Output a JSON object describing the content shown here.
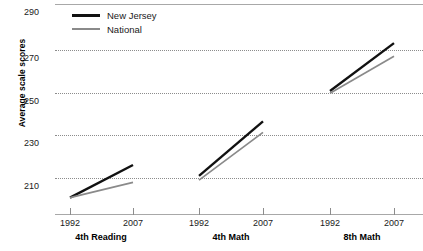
{
  "chart_data": {
    "type": "line",
    "title": "",
    "xlabel": "",
    "ylabel": "Average scale scores",
    "ylim": [
      200,
      290
    ],
    "yticks": [
      210,
      230,
      250,
      270,
      290
    ],
    "grid": true,
    "legend_position": "top-left",
    "x": [
      "1992",
      "2007"
    ],
    "panels": [
      {
        "label": "4th Reading",
        "series": [
          {
            "name": "New Jersey",
            "values": [
              201,
              216
            ]
          },
          {
            "name": "National",
            "values": [
              201,
              208
            ]
          }
        ]
      },
      {
        "label": "4th Math",
        "series": [
          {
            "name": "New Jersey",
            "values": [
              211,
              236
            ]
          },
          {
            "name": "National",
            "values": [
              209,
              231
            ]
          }
        ]
      },
      {
        "label": "8th Math",
        "series": [
          {
            "name": "New Jersey",
            "values": [
              250,
              272
            ]
          },
          {
            "name": "National",
            "values": [
              249,
              266
            ]
          }
        ]
      }
    ],
    "legend": [
      {
        "label": "New Jersey",
        "color": "#111111"
      },
      {
        "label": "National",
        "color": "#8a8a8a"
      }
    ]
  },
  "axis": {
    "y_label": "Average scale scores",
    "y_tick_290": "290",
    "y_tick_270": "270",
    "y_tick_250": "250",
    "y_tick_230": "230",
    "y_tick_210": "210"
  },
  "panels": {
    "reading4": {
      "label": "4th Reading",
      "tick_start": "1992",
      "tick_end": "2007"
    },
    "math4": {
      "label": "4th Math",
      "tick_start": "1992",
      "tick_end": "2007"
    },
    "math8": {
      "label": "8th Math",
      "tick_start": "1992",
      "tick_end": "2007"
    }
  },
  "legend": {
    "new_jersey": "New Jersey",
    "national": "National"
  },
  "colors": {
    "new_jersey": "#111111",
    "national": "#8a8a8a",
    "grid": "#8c8c8c",
    "axis": "#a8a8a8"
  }
}
